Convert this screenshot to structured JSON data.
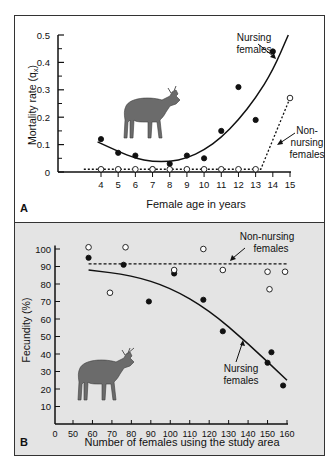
{
  "chart_data": [
    {
      "panel_label": "A",
      "type": "scatter",
      "title": "",
      "xlabel": "Female age in years",
      "ylabel": "Mortality rate (q",
      "ylabel_sub": "x",
      "ylabel_close": ")",
      "xlim": [
        3,
        15.3
      ],
      "ylim": [
        0,
        0.5
      ],
      "x_ticks": [
        4,
        5,
        6,
        7,
        8,
        9,
        10,
        11,
        12,
        13,
        14,
        15
      ],
      "y_ticks": [
        0,
        0.1,
        0.2,
        0.3,
        0.4,
        0.5
      ],
      "y_tick_labels": [
        "0",
        "0.1",
        "0.2",
        "0.3",
        "0.4",
        "0.5"
      ],
      "grid": false,
      "background": "#ffffff",
      "series": [
        {
          "name": "Nursing females",
          "marker": "filled-circle",
          "color": "#111111",
          "x": [
            4,
            5,
            6,
            7,
            8,
            9,
            10,
            11,
            12,
            13,
            14
          ],
          "y": [
            0.12,
            0.07,
            0.06,
            0.01,
            0.03,
            0.06,
            0.05,
            0.15,
            0.31,
            0.19,
            0.44
          ],
          "fit": "curve",
          "fit_curve": {
            "x": [
              3.8,
              5,
              6,
              7,
              8,
              9,
              10,
              11,
              12,
              13,
              14,
              14.9
            ],
            "y": [
              0.11,
              0.075,
              0.05,
              0.038,
              0.038,
              0.05,
              0.08,
              0.125,
              0.19,
              0.27,
              0.37,
              0.5
            ]
          },
          "annotation": "Nursing females"
        },
        {
          "name": "Non-nursing females",
          "marker": "open-circle",
          "color": "#111111",
          "x": [
            4,
            5,
            6,
            7,
            8,
            9,
            10,
            11,
            12,
            13,
            15
          ],
          "y": [
            0.01,
            0.01,
            0.01,
            0.01,
            0.01,
            0.01,
            0.01,
            0.01,
            0.01,
            0.01,
            0.27
          ],
          "fit": "dotted",
          "fit_curve": {
            "x": [
              3,
              13.3,
              15
            ],
            "y": [
              0.01,
              0.01,
              0.27
            ]
          },
          "annotation": "Non-nursing females"
        }
      ]
    },
    {
      "panel_label": "B",
      "type": "scatter",
      "title": "",
      "xlabel": "Number of females using the study area",
      "ylabel": "Fecundity (%)",
      "xlim": [
        0,
        160
      ],
      "x_axis_break": "0 to 50 compressed",
      "ylim": [
        0,
        100
      ],
      "x_ticks": [
        0,
        50,
        60,
        70,
        80,
        90,
        100,
        110,
        120,
        130,
        140,
        150,
        160
      ],
      "y_ticks": [
        10,
        20,
        30,
        40,
        50,
        60,
        70,
        80,
        90,
        100
      ],
      "grid": false,
      "background": "#e4e4e4",
      "series": [
        {
          "name": "Nursing females",
          "marker": "filled-circle",
          "color": "#111111",
          "x": [
            58,
            76,
            89,
            102,
            117,
            127,
            150,
            152,
            158
          ],
          "y": [
            95,
            91,
            70,
            86,
            71,
            53,
            35,
            41,
            22
          ],
          "fit": "curve",
          "fit_curve": {
            "x": [
              58,
              80,
              100,
              120,
              140,
              160
            ],
            "y": [
              88,
              85,
              78,
              65,
              46,
              25
            ]
          },
          "annotation": "Nursing females"
        },
        {
          "name": "Non-nursing females",
          "marker": "open-circle",
          "color": "#111111",
          "x": [
            58,
            69,
            77,
            102,
            117,
            127,
            150,
            151,
            159
          ],
          "y": [
            101,
            75,
            101,
            88,
            100,
            88,
            87,
            77,
            87
          ],
          "fit": "dashed",
          "fit_curve": {
            "x": [
              58,
              160
            ],
            "y": [
              91.5,
              91.5
            ]
          },
          "annotation": "Non-nursing females"
        }
      ]
    }
  ],
  "labels": {
    "a_nursing_1": "Nursing",
    "a_nursing_2": "females",
    "a_non_1": "Non-",
    "a_non_2": "nursing",
    "a_non_3": "females",
    "b_non_1": "Non-nursing",
    "b_non_2": "females",
    "b_nursing_1": "Nursing",
    "b_nursing_2": "females"
  }
}
